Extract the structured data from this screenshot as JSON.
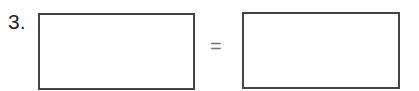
{
  "problem": {
    "number": "3.",
    "operator": "=",
    "left_answer": "",
    "right_answer": ""
  }
}
